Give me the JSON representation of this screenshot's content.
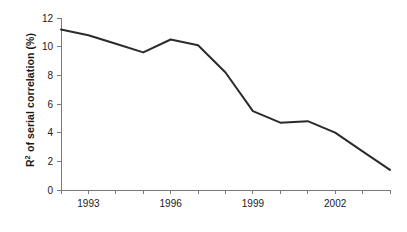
{
  "chart_data": {
    "type": "line",
    "title": "",
    "subtitle": "",
    "xlabel": "",
    "ylabel": "R2 of serial correlation (%)",
    "ylabel_base": "R",
    "ylabel_sup": "2",
    "ylabel_rest": " of serial correlation (%)",
    "x": [
      1992,
      1993,
      1994,
      1995,
      1996,
      1997,
      1998,
      1999,
      2000,
      2001,
      2002,
      2003,
      2004
    ],
    "values": [
      11.2,
      10.8,
      10.2,
      9.6,
      10.5,
      10.1,
      8.2,
      5.5,
      4.7,
      4.8,
      4.0,
      2.7,
      1.4
    ],
    "series": [
      {
        "name": "R2 of serial correlation",
        "values": [
          11.2,
          10.8,
          10.2,
          9.6,
          10.5,
          10.1,
          8.2,
          5.5,
          4.7,
          4.8,
          4.0,
          2.7,
          1.4
        ]
      }
    ],
    "xlim": [
      1992,
      2004
    ],
    "ylim": [
      0,
      12
    ],
    "x_tick_values": [
      1992,
      1993,
      1994,
      1995,
      1996,
      1997,
      1998,
      1999,
      2000,
      2001,
      2002,
      2003,
      2004
    ],
    "x_tick_labels": [
      "",
      "1993",
      "",
      "",
      "1996",
      "",
      "",
      "1999",
      "",
      "",
      "2002",
      "",
      ""
    ],
    "y_ticks": [
      0,
      2,
      4,
      6,
      8,
      10,
      12
    ],
    "y_tick_labels": [
      "0",
      "2",
      "4",
      "6",
      "8",
      "10",
      "12"
    ],
    "grid": false,
    "legend": false,
    "legend_position": "none",
    "line_color": "#2b2b2b",
    "axis_color": "#7a7a7a",
    "background_color": "#ffffff",
    "annotations": []
  }
}
